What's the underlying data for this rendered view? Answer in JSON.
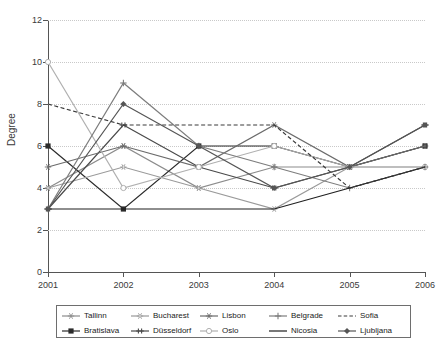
{
  "chart_data": {
    "type": "line",
    "title": "",
    "xlabel": "",
    "ylabel": "Degree",
    "x": [
      "2001",
      "2002",
      "2003",
      "2004",
      "2005",
      "2006"
    ],
    "categories": [
      "2001",
      "2002",
      "2003",
      "2004",
      "2005",
      "2006"
    ],
    "xlim": [
      2001,
      2006
    ],
    "ylim": [
      0,
      12
    ],
    "yticks": [
      0,
      2,
      4,
      6,
      8,
      10,
      12
    ],
    "ytick_labels": [
      "0",
      "2",
      "4",
      "6",
      "8",
      "10",
      "12"
    ],
    "grid": "horizontal-dotted",
    "legend_position": "bottom",
    "legend_columns": 5,
    "legend_rows": 2,
    "series": [
      {
        "name": "Tallinn",
        "values": [
          4,
          6,
          4,
          5,
          5,
          6
        ],
        "marker": "star",
        "dash": "solid",
        "color": "#8c8c8c"
      },
      {
        "name": "Bratislava",
        "values": [
          6,
          3,
          6,
          6,
          5,
          6
        ],
        "marker": "square",
        "dash": "solid",
        "color": "#2b2b2b"
      },
      {
        "name": "Bucharest",
        "values": [
          4,
          5,
          4,
          3,
          5,
          5
        ],
        "marker": "open-star",
        "dash": "solid",
        "color": "#9a9a9a"
      },
      {
        "name": "Düsseldorf",
        "values": [
          3,
          7,
          5,
          4,
          5,
          7
        ],
        "marker": "double-cross",
        "dash": "solid",
        "color": "#4a4a4a"
      },
      {
        "name": "Lisbon",
        "values": [
          5,
          6,
          5,
          7,
          5,
          6
        ],
        "marker": "asterisk",
        "dash": "solid",
        "color": "#6b6b6b"
      },
      {
        "name": "Oslo",
        "values": [
          10,
          4,
          5,
          6,
          5,
          5
        ],
        "marker": "open-circle",
        "dash": "solid",
        "color": "#b0b0b0"
      },
      {
        "name": "Belgrade",
        "values": [
          3,
          9,
          6,
          5,
          4,
          5
        ],
        "marker": "plus",
        "dash": "solid",
        "color": "#7d7d7d"
      },
      {
        "name": "Nicosia",
        "values": [
          3,
          3,
          3,
          3,
          4,
          5
        ],
        "marker": "none",
        "dash": "solid",
        "color": "#1f1f1f"
      },
      {
        "name": "Sofia",
        "values": [
          8,
          7,
          7,
          7,
          4,
          5
        ],
        "marker": "none",
        "dash": "dashed",
        "color": "#3a3a3a"
      },
      {
        "name": "Ljubljana",
        "values": [
          3,
          8,
          6,
          4,
          5,
          7
        ],
        "marker": "diamond",
        "dash": "solid",
        "color": "#555555"
      }
    ]
  },
  "axis": {
    "y_title": "Degree"
  }
}
